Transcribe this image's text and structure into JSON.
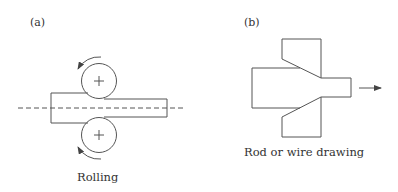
{
  "figure": {
    "panels": [
      {
        "id": "a",
        "label": "(a)",
        "caption": "Rolling",
        "elements": {
          "workpiece": "strip-before-after-rolls",
          "top_roll": {
            "icon": "roll-with-center-cross",
            "rotation": "counterclockwise"
          },
          "bottom_roll": {
            "icon": "roll-with-center-cross",
            "rotation": "clockwise"
          },
          "centerline": "dashed"
        }
      },
      {
        "id": "b",
        "label": "(b)",
        "caption": "Rod or wire drawing",
        "elements": {
          "die": "conical-drawing-die",
          "rod": "rod-reduced-through-die",
          "pull_direction": "arrow-right"
        }
      }
    ],
    "colors": {
      "line": "#555555",
      "text": "#333333",
      "background": "#ffffff"
    }
  }
}
